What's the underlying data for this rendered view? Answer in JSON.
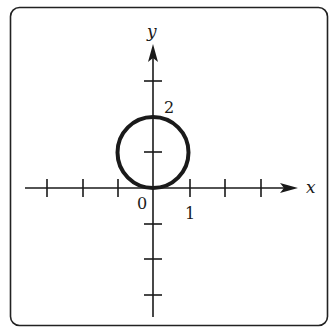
{
  "diagram": {
    "type": "coordinate-plane-graph",
    "frame": {
      "stroke": "#222222",
      "fill": "#ffffff",
      "corner_radius": 9
    },
    "axes": {
      "x_label": "x",
      "y_label": "y",
      "origin_label": "0",
      "x_tick_label": "1",
      "y_tick_label": "2",
      "x_ticks": [
        -3,
        -2,
        -1,
        1,
        2,
        3
      ],
      "y_ticks": [
        -3,
        -2,
        -1,
        1,
        2,
        3
      ],
      "color": "#1a1a1a"
    },
    "curve": {
      "shape": "circle",
      "center": [
        0,
        1
      ],
      "radius": 1,
      "equation": "x^2 + (y-1)^2 = 1",
      "stroke": "#1a1a1a"
    }
  }
}
